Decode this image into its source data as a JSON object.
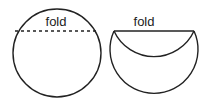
{
  "diagram": {
    "left": {
      "label": "fold",
      "shape": "circle",
      "fold_line": "dashed"
    },
    "right": {
      "label": "fold",
      "shape": "folded-circle",
      "fold_line": "solid"
    },
    "stroke_color": "#222222"
  }
}
